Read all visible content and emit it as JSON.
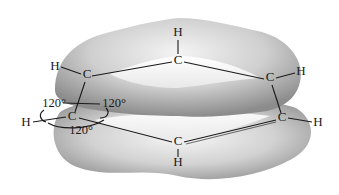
{
  "diagram": {
    "atoms": {
      "c_top": {
        "label": "C",
        "x": 178,
        "y": 64
      },
      "c_upper_left": {
        "label": "C",
        "x": 87,
        "y": 78
      },
      "c_upper_right": {
        "label": "C",
        "x": 270,
        "y": 81
      },
      "c_left": {
        "label": "C",
        "x": 72,
        "y": 120
      },
      "c_lower_right": {
        "label": "C",
        "x": 282,
        "y": 121
      },
      "c_bottom": {
        "label": "C",
        "x": 178,
        "y": 145
      },
      "h_top": {
        "label": "H",
        "x": 178,
        "y": 36
      },
      "h_upper_left": {
        "label": "H",
        "x": 55,
        "y": 70
      },
      "h_upper_right": {
        "label": "H",
        "x": 301,
        "y": 75
      },
      "h_left": {
        "label": "H",
        "x": 26,
        "y": 126
      },
      "h_lower_right": {
        "label": "H",
        "x": 318,
        "y": 126
      },
      "h_bottom": {
        "label": "H",
        "x": 178,
        "y": 166
      }
    },
    "angles": [
      {
        "label": "120°",
        "x": 54,
        "y": 107
      },
      {
        "label": "120°",
        "x": 112,
        "y": 107
      },
      {
        "label": "120°",
        "x": 81,
        "y": 133
      }
    ],
    "colors": {
      "cloud_light": "#f2f2f2",
      "cloud_mid": "#c4c4c4",
      "cloud_dark": "#8a8a8a",
      "bond": "#1a1a1a",
      "background": "#ffffff"
    }
  }
}
